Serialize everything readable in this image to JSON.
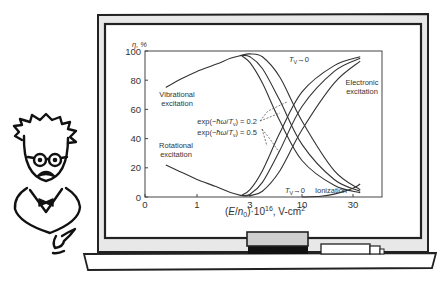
{
  "chart_data": {
    "type": "line",
    "title": "",
    "ylabel": "η, %",
    "xlabel": "(E/n0)·10^16, V·cm²",
    "xlabel_parts": {
      "pre": "(",
      "E": "E",
      "slash": "/",
      "n": "n",
      "sub": "0",
      "post": ")·10",
      "sup": "16",
      "tail": ", V·cm",
      "sup2": "2"
    },
    "x_scale": "log-like (evenly spaced ticks)",
    "x_ticks": [
      0,
      1,
      3,
      10,
      30
    ],
    "x_tick_labels": [
      "0",
      "1",
      "3",
      "10",
      "30"
    ],
    "y_ticks": [
      0,
      20,
      40,
      60,
      80,
      100
    ],
    "y_tick_labels": [
      "0",
      "20",
      "40",
      "60",
      "80",
      "100"
    ],
    "ylim": [
      0,
      100
    ],
    "grid": false,
    "series": [
      {
        "name": "Vibrational excitation (common)",
        "x": [
          0.4,
          0.7,
          1,
          1.5,
          2,
          2.5
        ],
        "y": [
          75,
          81,
          86,
          91,
          95,
          97
        ]
      },
      {
        "name": "Vibrational excitation, exp(-ħω/Tv)=0.5",
        "x": [
          2.5,
          3,
          4,
          6,
          10,
          20,
          35
        ],
        "y": [
          97,
          92,
          78,
          52,
          25,
          8,
          3
        ]
      },
      {
        "name": "Vibrational excitation, exp(-ħω/Tv)=0.2",
        "x": [
          2.5,
          3,
          4,
          6,
          10,
          20,
          35
        ],
        "y": [
          97,
          96,
          88,
          66,
          36,
          12,
          4
        ]
      },
      {
        "name": "Vibrational excitation, Tv→0",
        "x": [
          2.5,
          3,
          4,
          6,
          10,
          20,
          35
        ],
        "y": [
          97,
          98,
          96,
          82,
          52,
          18,
          5
        ]
      },
      {
        "name": "Rotational excitation",
        "x": [
          0.4,
          0.7,
          1,
          1.5,
          2,
          2.5
        ],
        "y": [
          22,
          17,
          12,
          7,
          3,
          1
        ]
      },
      {
        "name": "Electronic excitation, exp(-ħω/Tv)=0.5",
        "x": [
          2.5,
          3,
          4,
          6,
          10,
          20,
          35
        ],
        "y": [
          1,
          5,
          18,
          44,
          72,
          90,
          96
        ]
      },
      {
        "name": "Electronic excitation, exp(-ħω/Tv)=0.2",
        "x": [
          2.5,
          3,
          4,
          6,
          10,
          20,
          35
        ],
        "y": [
          1,
          2,
          10,
          32,
          62,
          86,
          95
        ]
      },
      {
        "name": "Electronic excitation, Tv→0",
        "x": [
          2.5,
          3,
          4,
          6,
          10,
          20,
          35
        ],
        "y": [
          1,
          1,
          4,
          18,
          46,
          78,
          93
        ]
      },
      {
        "name": "Ionization",
        "x": [
          10,
          15,
          20,
          30,
          35
        ],
        "y": [
          0,
          0.5,
          2,
          6,
          9
        ]
      }
    ],
    "annotations": [
      {
        "text": "Vibrational",
        "line2": "excitation"
      },
      {
        "text": "Rotational",
        "line2": "excitation"
      },
      {
        "text": "Electronic",
        "line2": "excitation"
      },
      {
        "text": "Tv→0 (upper)",
        "label_T": "T",
        "label_sub": "V",
        "label_arrow": "→0"
      },
      {
        "text": "Tv→0 (lower)",
        "label_T": "T",
        "label_sub": "V",
        "label_arrow": "→0"
      },
      {
        "text": "Ionization"
      },
      {
        "text": "exp(−ħω/Tv) = 0.2",
        "pre": "exp(−",
        "hw": "ħω",
        "slash": "/",
        "T": "T",
        "sub": "v",
        "post": ") = 0.2"
      },
      {
        "text": "exp(−ħω/Tv) = 0.5",
        "pre": "exp(−",
        "hw": "ħω",
        "slash": "/",
        "T": "T",
        "sub": "v",
        "post": ") = 0.5"
      }
    ]
  },
  "labels": {
    "y_axis": "η, %",
    "vib1": "Vibrational",
    "vib2": "excitation",
    "rot1": "Rotational",
    "rot2": "excitation",
    "ele1": "Electronic",
    "ele2": "excitation",
    "ionization": "Ionization",
    "tv_T": "T",
    "tv_sub": "V",
    "tv_arrow": "→0",
    "exp02_pre": "exp(−",
    "exp_hw": "ħω",
    "exp_slash": "/",
    "exp_T": "T",
    "exp_sub": "v",
    "exp02_post": ") = 0.2",
    "exp05_post": ") = 0.5",
    "xl_a": "(",
    "xl_E": "E",
    "xl_slash": "/",
    "xl_n": "n",
    "xl_sub": "0",
    "xl_b": ")·10",
    "xl_sup": "16",
    "xl_c": ", V-cm",
    "xl_sup2": "2"
  },
  "colors": {
    "ink": "#222222",
    "frame_fill": "#e6e6e6",
    "board": "#ffffff",
    "eraser_top": "#cfcfcf",
    "eraser_base": "#111111"
  }
}
